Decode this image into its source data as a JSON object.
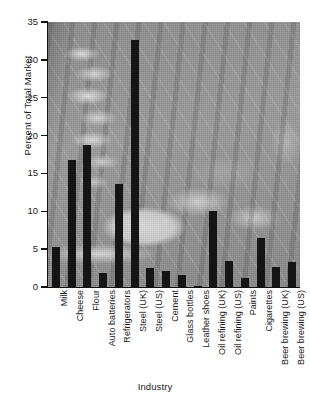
{
  "chart_data": {
    "type": "bar",
    "title": "",
    "xlabel": "Industry",
    "ylabel": "Percent of Total Market",
    "ylim": [
      0,
      35
    ],
    "ytick_values": [
      0,
      5,
      10,
      15,
      20,
      25,
      30,
      35
    ],
    "ytick_labels": [
      "0",
      "5",
      "10",
      "15",
      "20",
      "25",
      "30",
      "35"
    ],
    "grid": false,
    "legend": "none",
    "bar_color": "#151515",
    "plot_background": "grayscale-industrial-photograph",
    "categories": [
      "Milk",
      "Cheese",
      "Flour",
      "Auto batteries",
      "Refrigerators",
      "Steel (UK)",
      "Steel (US)",
      "Cement",
      "Glass bottles",
      "Leather shoes",
      "Oil refining (UK)",
      "Oil refining (US)",
      "Paints",
      "Cigarettes",
      "Beer brewing (UK)",
      "Beer brewing (US)"
    ],
    "values": [
      5.3,
      16.8,
      18.7,
      1.9,
      13.6,
      32.6,
      2.5,
      2.1,
      1.6,
      0.2,
      10.1,
      3.4,
      1.2,
      6.5,
      2.7,
      3.3
    ]
  }
}
